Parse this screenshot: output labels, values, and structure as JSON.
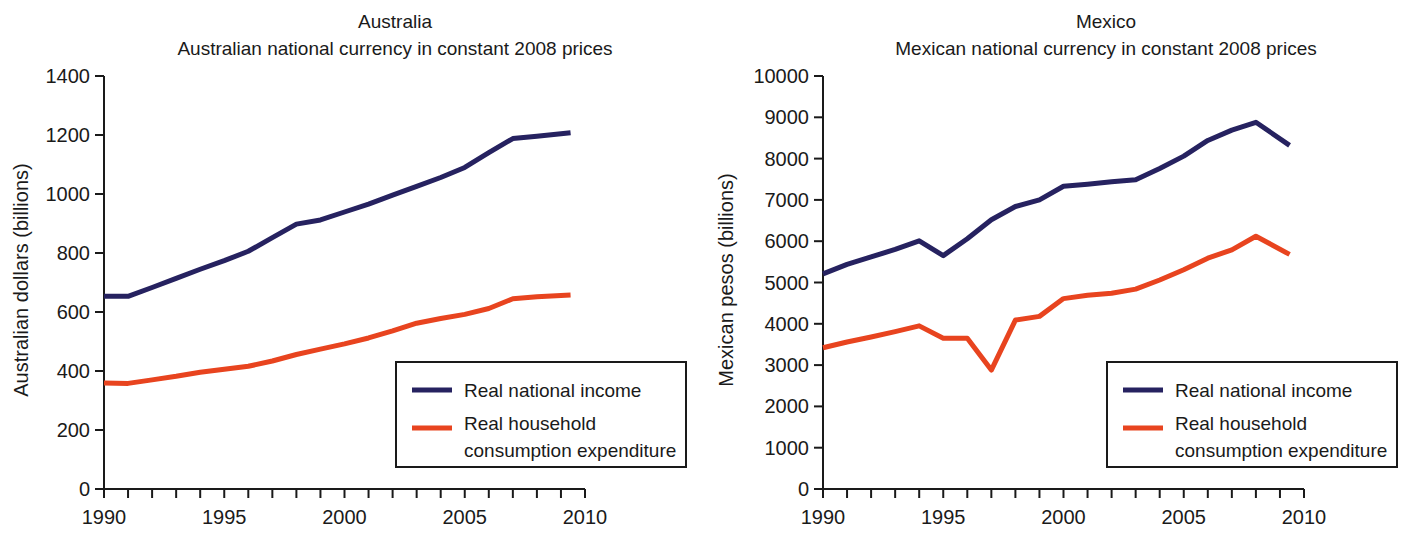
{
  "colors": {
    "income": "#262260",
    "consumption": "#e8441f",
    "axis": "#1a1a1a",
    "background": "#ffffff"
  },
  "legend": {
    "income_label": "Real national income",
    "consumption_label_line1": "Real household",
    "consumption_label_line2": "consumption expenditure"
  },
  "chart_data": [
    {
      "type": "line",
      "id": "australia",
      "title": "Australia",
      "subtitle": "Australian national currency in constant 2008 prices",
      "xlabel": "",
      "ylabel": "Australian dollars (billions)",
      "xlim": [
        1990,
        2010
      ],
      "ylim": [
        0,
        1400
      ],
      "ytick_step": 200,
      "yticks": [
        0,
        200,
        400,
        600,
        800,
        1000,
        1200,
        1400
      ],
      "ytick_labels": [
        "0",
        "200",
        "400",
        "600",
        "800",
        "1000",
        "1200",
        "1400"
      ],
      "xticks": [
        1990,
        1995,
        2000,
        2005,
        2010
      ],
      "xtick_labels": [
        "1990",
        "1995",
        "2000",
        "2005",
        "2010"
      ],
      "xminor_step": 1,
      "grid": false,
      "legend_position": "lower-right",
      "x": [
        1990,
        1991,
        1992,
        1993,
        1994,
        1995,
        1996,
        1997,
        1998,
        1999,
        2000,
        2001,
        2002,
        2003,
        2004,
        2005,
        2006,
        2007,
        2008,
        2009.4
      ],
      "series": [
        {
          "name": "Real national income",
          "color": "#262260",
          "values": [
            653,
            653,
            683,
            714,
            745,
            774,
            806,
            852,
            898,
            912,
            939,
            966,
            996,
            1026,
            1056,
            1090,
            1140,
            1188,
            1196,
            1208
          ]
        },
        {
          "name": "Real household consumption expenditure",
          "color": "#e8441f",
          "values": [
            359,
            358,
            370,
            382,
            396,
            406,
            416,
            434,
            456,
            474,
            492,
            512,
            536,
            562,
            578,
            592,
            612,
            645,
            652,
            658
          ]
        }
      ]
    },
    {
      "type": "line",
      "id": "mexico",
      "title": "Mexico",
      "subtitle": "Mexican national currency in constant 2008 prices",
      "xlabel": "",
      "ylabel": "Mexican pesos (billions)",
      "xlim": [
        1990,
        2010
      ],
      "ylim": [
        0,
        10000
      ],
      "ytick_step": 1000,
      "yticks": [
        0,
        1000,
        2000,
        3000,
        4000,
        5000,
        6000,
        7000,
        8000,
        9000,
        10000
      ],
      "ytick_labels": [
        "0",
        "1000",
        "2000",
        "3000",
        "4000",
        "5000",
        "6000",
        "7000",
        "8000",
        "9000",
        "10000"
      ],
      "xticks": [
        1990,
        1995,
        2000,
        2005,
        2010
      ],
      "xtick_labels": [
        "1990",
        "1995",
        "2000",
        "2005",
        "2010"
      ],
      "xminor_step": 1,
      "grid": false,
      "legend_position": "lower-right",
      "x": [
        1990,
        1991,
        1992,
        1993,
        1994,
        1995,
        1996,
        1997,
        1998,
        1999,
        2000,
        2001,
        2002,
        2003,
        2004,
        2005,
        2006,
        2007,
        2008,
        2009.4
      ],
      "series": [
        {
          "name": "Real national income",
          "color": "#262260",
          "values": [
            5210,
            5440,
            5620,
            5800,
            6010,
            5650,
            6060,
            6520,
            6840,
            7000,
            7330,
            7380,
            7440,
            7490,
            7760,
            8060,
            8440,
            8690,
            8880,
            8320
          ]
        },
        {
          "name": "Real household consumption expenditure",
          "color": "#e8441f",
          "values": [
            3420,
            3560,
            3680,
            3810,
            3950,
            3650,
            3650,
            2880,
            4090,
            4180,
            4610,
            4690,
            4740,
            4840,
            5060,
            5310,
            5590,
            5790,
            6120,
            5680
          ]
        }
      ]
    }
  ]
}
